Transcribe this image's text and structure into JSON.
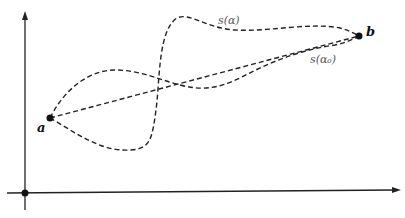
{
  "diagram": {
    "points": [
      {
        "label": "a",
        "x": 50,
        "y": 118
      },
      {
        "label": "b",
        "x": 359,
        "y": 36
      }
    ],
    "curve_labels": {
      "s_alpha": "s(α)",
      "s_alpha0": "s(α₀)"
    },
    "axes": {
      "origin_marker": true,
      "x_arrow": true,
      "y_arrow": true
    },
    "colors": {
      "ink": "#111111",
      "label_gray": "#555555"
    }
  }
}
